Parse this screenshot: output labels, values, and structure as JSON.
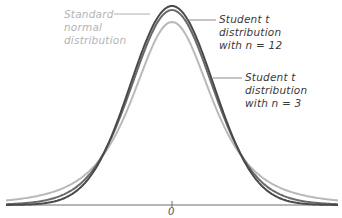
{
  "labels": {
    "normal": [
      "Standard",
      "normal",
      "distribution"
    ],
    "t12": [
      "Student t",
      "distribution",
      "with n = 12"
    ],
    "t3": [
      "Student t",
      "distribution",
      "with n = 3"
    ]
  },
  "axis": {
    "zero_label": "0"
  },
  "colors": {
    "background": "#ffffff",
    "axis": "#6e6e6e",
    "leader_line": "#6e6e6e",
    "curve_light": "#b9b9b9",
    "curve_mid": "#4a4a4a",
    "curve_dark": "#6a6a6a",
    "label_light": "#b4b4b4",
    "label_dark": "#3a3a3a"
  },
  "chart_data": {
    "type": "line",
    "title": "",
    "xlabel": "",
    "ylabel": "",
    "x_tick_labels": [
      "0"
    ],
    "xlim": [
      -4,
      4
    ],
    "grid": false,
    "legend": "none (inline text annotations with leader lines)",
    "annotations": [
      "Standard normal distribution",
      "Student t distribution with n = 12",
      "Student t distribution with n = 3"
    ],
    "series": [
      {
        "name": "Curve A (dark, tallest peak, thinnest tails)",
        "kind": "bell",
        "visual_peak_px_y": 6,
        "visual_tail_px_y": 202
      },
      {
        "name": "Curve B (dark, second-tallest peak)",
        "kind": "bell",
        "visual_peak_px_y": 10,
        "visual_tail_px_y": 198
      },
      {
        "name": "Curve C (light gray, lowest peak, heaviest tails)",
        "kind": "bell",
        "visual_peak_px_y": 22,
        "visual_tail_px_y": 190
      }
    ]
  }
}
